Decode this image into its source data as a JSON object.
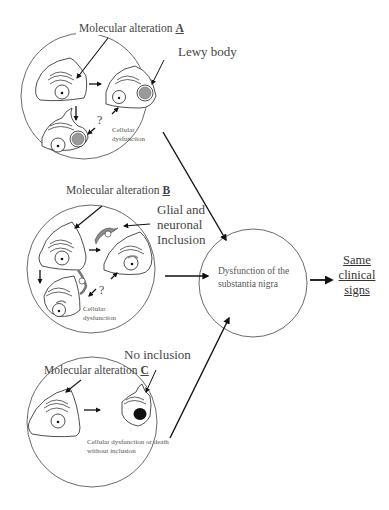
{
  "diagram": {
    "type": "pathway-diagram",
    "panels": [
      {
        "id": "A",
        "title_prefix": "Molecular alteration",
        "title_letter": "A",
        "annotation": "Lewy body",
        "caption": "Cellular dysfunction",
        "question_mark": "?"
      },
      {
        "id": "B",
        "title_prefix": "Molecular alteration",
        "title_letter": "B",
        "annotation": "Glial and neuronal Inclusion",
        "annotation_lines": [
          "Glial and",
          "neuronal",
          "Inclusion"
        ],
        "caption": "Cellular dysfunction",
        "question_mark": "?"
      },
      {
        "id": "C",
        "title_prefix": "Molecular alteration",
        "title_letter": "C",
        "annotation": "No inclusion",
        "caption_lines": [
          "Cellular dysfunction or death",
          "without inclusion"
        ]
      }
    ],
    "central_node": {
      "lines": [
        "Dysfunction of the",
        "substantia nigra"
      ]
    },
    "outcome": {
      "lines": [
        "Same",
        "clinical",
        "signs"
      ]
    },
    "colors": {
      "line": "#222222",
      "inclusion_gray": "#9a9a9a",
      "inclusion_black": "#111111",
      "background": "#ffffff"
    }
  }
}
